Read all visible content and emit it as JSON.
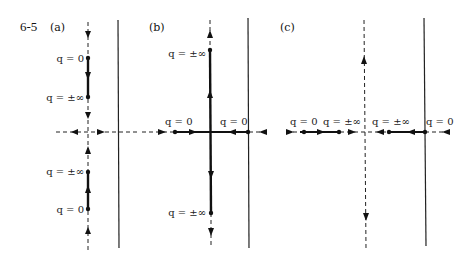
{
  "figure": {
    "number": "6-5",
    "panels": [
      {
        "id": "a",
        "label": "(a)",
        "labels": [
          {
            "text": "q = 0",
            "x": 86,
            "y": 58
          },
          {
            "text": "q = ±∞",
            "x": 86,
            "y": 97
          },
          {
            "text": "q = ±∞",
            "x": 86,
            "y": 173
          },
          {
            "text": "q = 0",
            "x": 86,
            "y": 211
          }
        ]
      },
      {
        "id": "b",
        "label": "(b)",
        "labels": [
          {
            "text": "q = ±∞",
            "x": 207,
            "y": 54
          },
          {
            "text": "q = 0",
            "x": 174,
            "y": 123
          },
          {
            "text": "q = 0",
            "x": 246,
            "y": 123
          },
          {
            "text": "q = ±∞",
            "x": 207,
            "y": 215
          }
        ]
      },
      {
        "id": "c",
        "label": "(c)",
        "labels": [
          {
            "text": "q = 0",
            "x": 291,
            "y": 123
          },
          {
            "text": "q = ±∞",
            "x": 338,
            "y": 123
          },
          {
            "text": "q = ±∞",
            "x": 372,
            "y": 123
          },
          {
            "text": "q = 0",
            "x": 427,
            "y": 123
          }
        ]
      }
    ]
  }
}
